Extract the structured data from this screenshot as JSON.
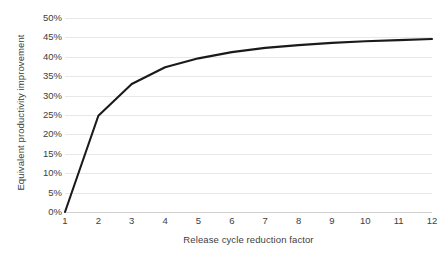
{
  "chart_data": {
    "type": "line",
    "title": "",
    "subtitle": "",
    "xlabel": "Release cycle reduction factor",
    "ylabel": "Equivalent productivity improvement",
    "x": [
      1,
      2,
      3,
      4,
      5,
      6,
      7,
      8,
      9,
      10,
      11,
      12
    ],
    "xtick_labels": [
      "1",
      "2",
      "3",
      "4",
      "5",
      "6",
      "7",
      "8",
      "9",
      "10",
      "11",
      "12"
    ],
    "ytick_labels": [
      "0%",
      "5%",
      "10%",
      "15%",
      "20%",
      "25%",
      "30%",
      "35%",
      "40%",
      "45%",
      "50%"
    ],
    "ytick_values": [
      0,
      5,
      10,
      15,
      20,
      25,
      30,
      35,
      40,
      45,
      50
    ],
    "xlim": [
      1,
      12
    ],
    "ylim": [
      0,
      50
    ],
    "grid": "horizontal",
    "legend": "none",
    "series": [
      {
        "name": "Equivalent productivity improvement",
        "color": "#1a1a1a",
        "line_width": 2.1,
        "values": [
          0.0,
          24.8,
          33.0,
          37.3,
          39.6,
          41.2,
          42.3,
          43.0,
          43.6,
          44.0,
          44.3,
          44.6
        ]
      }
    ]
  },
  "axes": {
    "y_title": "Equivalent productivity improvement",
    "x_title": "Release cycle reduction factor"
  },
  "colors": {
    "series_line": "#1a1a1a",
    "gridline": "#e8e8e8",
    "baseline": "#d2d2d2",
    "text": "#404040",
    "background": "#ffffff"
  }
}
